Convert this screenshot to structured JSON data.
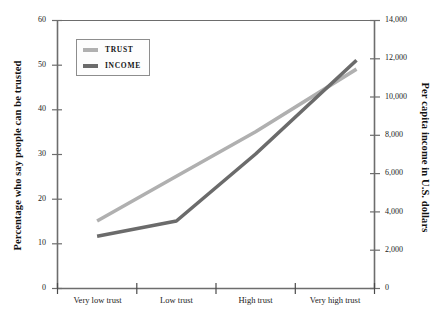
{
  "chart_data": {
    "type": "line",
    "title": "",
    "categories": [
      "Very low trust",
      "Low trust",
      "High trust",
      "Very high trust"
    ],
    "series": [
      {
        "name": "TRUST",
        "axis": "left",
        "color": "#b0b0b0",
        "values": [
          15,
          25,
          35,
          49
        ]
      },
      {
        "name": "INCOME",
        "axis": "right",
        "color": "#6b6b6b",
        "values": [
          2700,
          3500,
          7000,
          11900
        ]
      }
    ],
    "left_axis": {
      "label": "Percentage who say people can be trusted",
      "ticks": [
        "0",
        "10",
        "20",
        "30",
        "40",
        "50",
        "60"
      ],
      "min": 0,
      "max": 60
    },
    "right_axis": {
      "label": "Per capita income in U.S. dollars",
      "ticks": [
        "0",
        "2,000",
        "4,000",
        "6,000",
        "8,000",
        "10,000",
        "12,000",
        "14,000"
      ],
      "min": 0,
      "max": 14000
    },
    "xlabel": "",
    "grid": false,
    "legend_position": "inside-top-left"
  },
  "legend": {
    "items": [
      {
        "label": "TRUST",
        "color": "#b0b0b0"
      },
      {
        "label": "INCOME",
        "color": "#6b6b6b"
      }
    ]
  },
  "colors": {
    "trust_line": "#b0b0b0",
    "income_line": "#6b6b6b",
    "axis": "#6d6d6d",
    "text": "#1a1a1a",
    "legend_border": "#8d8d8d",
    "background": "#ffffff"
  }
}
